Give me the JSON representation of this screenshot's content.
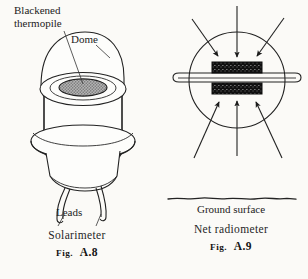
{
  "page": {
    "background_color": "#fbfaf7",
    "ink_color": "#222222"
  },
  "figures": [
    {
      "id": "fig-a8",
      "device_name": "Solarimeter",
      "figure_prefix": "Fig.",
      "figure_number": "A.8",
      "labels": {
        "thermopile_line1": "Blackened",
        "thermopile_line2": "thermopile",
        "dome": "Dome",
        "leads": "Leads"
      },
      "parts": [
        "dome-hemisphere",
        "rim-ellipse",
        "blackened-thermopile-disc",
        "cylindrical-body",
        "flange-ring",
        "tapered-base",
        "lead-wires"
      ],
      "thermopile_fill": "#9a9a9a"
    },
    {
      "id": "fig-a9",
      "device_name": "Net radiometer",
      "figure_prefix": "Fig.",
      "figure_number": "A.9",
      "labels": {
        "ground_surface": "Ground surface"
      },
      "parts": [
        "spherical-dome-outline",
        "horizontal-sensor-plate",
        "upper-blackened-plate",
        "lower-blackened-plate",
        "incoming-radiation-arrows-upper",
        "incoming-radiation-arrows-lower",
        "ground-surface-line"
      ],
      "arrow_count_upper": 3,
      "arrow_count_lower": 3,
      "plate_fill": "#111111"
    }
  ]
}
